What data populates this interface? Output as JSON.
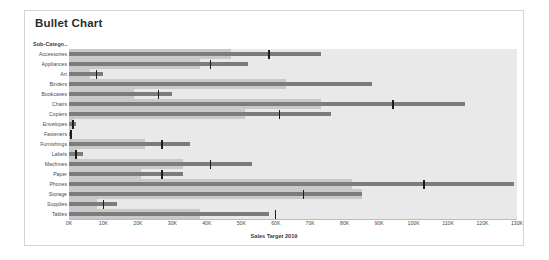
{
  "card": {
    "title": "Bullet Chart",
    "row_header": "Sub-Catego..",
    "axis_title": "Sales Target 2019"
  },
  "colors": {
    "bar": "#7c7c7c",
    "band": "#c9c9c9",
    "plot_background": "#e9e9e9",
    "tick_marker": "#1c1c1c",
    "card_border": "#d4d4d4",
    "title_text": "#2b2b2b"
  },
  "chart_data": {
    "type": "bar",
    "title": "Bullet Chart",
    "xlabel": "Sales Target 2019",
    "ylabel": "Sub-Catego..",
    "xlim": [
      0,
      130000
    ],
    "grid": false,
    "legend": null,
    "tick_labels": [
      "0K",
      "10K",
      "20K",
      "30K",
      "40K",
      "50K",
      "60K",
      "70K",
      "80K",
      "90K",
      "100K",
      "110K",
      "120K",
      "130K"
    ],
    "tick_values": [
      0,
      10000,
      20000,
      30000,
      40000,
      50000,
      60000,
      70000,
      80000,
      90000,
      100000,
      110000,
      120000,
      130000
    ],
    "categories": [
      "Accessories",
      "Appliances",
      "Art",
      "Binders",
      "Bookcases",
      "Chairs",
      "Copiers",
      "Envelopes",
      "Fasteners",
      "Furnishings",
      "Labels",
      "Machines",
      "Paper",
      "Phones",
      "Storage",
      "Supplies",
      "Tables"
    ],
    "series": [
      {
        "name": "Actual",
        "values": [
          73000,
          52000,
          10000,
          88000,
          30000,
          115000,
          76000,
          2000,
          900,
          35000,
          4000,
          53000,
          33000,
          129000,
          85000,
          14000,
          58000
        ]
      },
      {
        "name": "Reference range",
        "values": [
          47000,
          38000,
          6000,
          63000,
          19000,
          73000,
          51000,
          1200,
          600,
          22000,
          2400,
          33000,
          21000,
          82000,
          85000,
          8000,
          38000
        ]
      },
      {
        "name": "Target",
        "values": [
          58000,
          41000,
          8000,
          0,
          26000,
          94000,
          61000,
          1200,
          600,
          27000,
          2000,
          41000,
          27000,
          103000,
          68000,
          10000,
          60000
        ]
      }
    ]
  }
}
